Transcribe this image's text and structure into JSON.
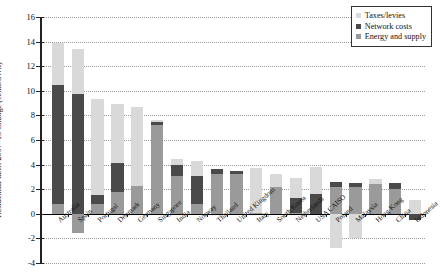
{
  "chart_data": {
    "type": "bar",
    "stacked": true,
    "title": "",
    "xlabel": "",
    "ylabel": "Residential tariff 2007–13 Change (cents/kWh)",
    "ylim": [
      -4,
      16
    ],
    "yticks": [
      -4,
      -2,
      0,
      2,
      4,
      6,
      8,
      10,
      12,
      14,
      16
    ],
    "ytick_labels": [
      "-4",
      "-2",
      "0",
      "2",
      "4",
      "6",
      "8",
      "10",
      "12",
      "14",
      "16"
    ],
    "grid": true,
    "grid_style": "dotted horizontal",
    "legend_position": "top-right",
    "categories": [
      "Australia",
      "Spain",
      "Portugal",
      "Denmark",
      "Germany",
      "Singapore",
      "India",
      "Norway",
      "Thailand",
      "United Kingdom",
      "Italy",
      "South Korea",
      "Netherlands",
      "USA CAISO",
      "Poland",
      "Malaysia",
      "Hong Kong",
      "China",
      "Indonesia"
    ],
    "series": [
      {
        "name": "Energy and supply",
        "color": "#9a9a9a",
        "values": [
          0.8,
          -1.6,
          0.8,
          1.8,
          2.3,
          7.2,
          3.1,
          0.8,
          3.2,
          3.2,
          0.1,
          2.2,
          0.1,
          0.0,
          2.2,
          2.2,
          2.4,
          2.0,
          0.0
        ]
      },
      {
        "name": "Network costs",
        "color": "#4a4a4a",
        "values": [
          9.7,
          9.7,
          0.7,
          2.3,
          0.0,
          0.25,
          0.9,
          2.3,
          0.45,
          0.3,
          0.0,
          0.0,
          1.2,
          1.6,
          0.4,
          0.3,
          0.0,
          0.5,
          -0.5
        ]
      },
      {
        "name": "Taxes/levies",
        "color": "#d9d9d9",
        "values": [
          3.4,
          3.7,
          7.8,
          4.8,
          6.4,
          0.15,
          0.45,
          1.2,
          0.0,
          0.0,
          3.6,
          1.0,
          1.6,
          2.2,
          -2.8,
          -2.0,
          0.4,
          0.0,
          1.1
        ]
      }
    ],
    "bar_totals": [
      13.9,
      11.8,
      9.3,
      8.9,
      8.7,
      7.6,
      4.45,
      4.3,
      3.65,
      3.5,
      3.7,
      3.2,
      2.9,
      3.8,
      2.6,
      2.5,
      2.8,
      2.5,
      1.1
    ]
  },
  "legend": {
    "items": [
      {
        "label": "Taxes/levies",
        "color": "#d9d9d9",
        "marker": "square-swatch-icon"
      },
      {
        "label": "Network costs",
        "color": "#4a4a4a",
        "marker": "square-swatch-icon"
      },
      {
        "label": "Energy and supply",
        "color": "#9a9a9a",
        "marker": "square-swatch-icon"
      }
    ]
  }
}
